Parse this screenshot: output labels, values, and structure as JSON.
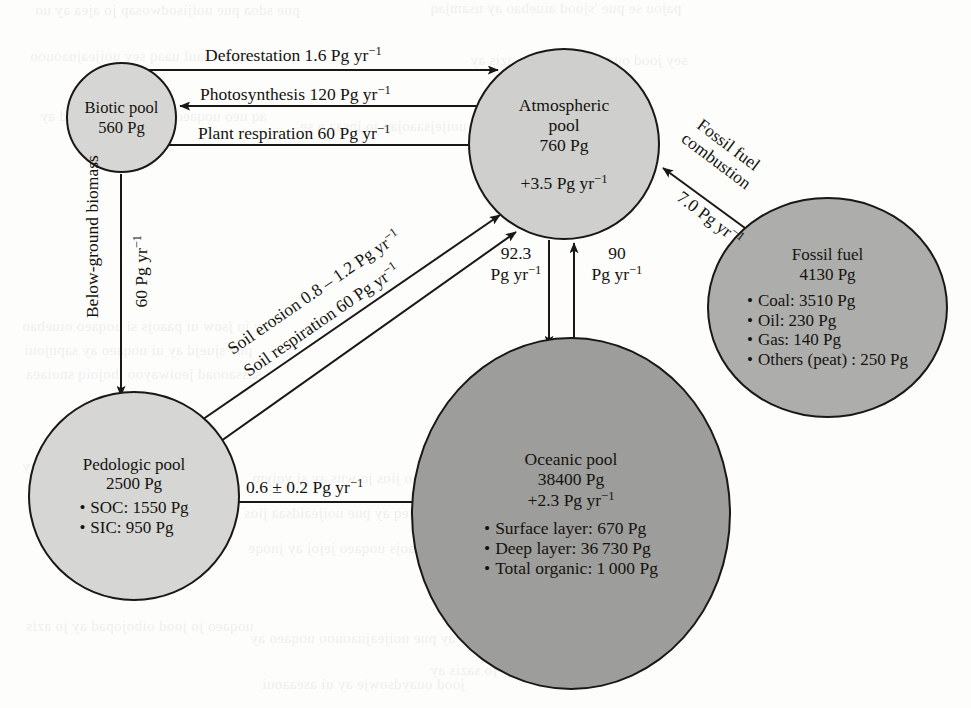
{
  "figure": {
    "type": "carbon-cycle-flow-diagram",
    "units": "Pg (petagrams C), fluxes in Pg yr^-1"
  },
  "pools": {
    "biotic": {
      "name": "Biotic pool",
      "stock": "560 Pg",
      "fill": "#d6d6d4"
    },
    "atmospheric": {
      "name": "Atmospheric\npool",
      "stock": "760 Pg",
      "delta": "+3.5 Pg yr",
      "delta_exp": "−1",
      "fill": "#cfcfcd"
    },
    "fossil": {
      "name": "Fossil fuel",
      "stock": "4130 Pg",
      "fill": "#adadab",
      "items": [
        "Coal: 3510 Pg",
        "Oil: 230 Pg",
        "Gas: 140 Pg",
        "Others (peat) : 250 Pg"
      ]
    },
    "pedologic": {
      "name": "Pedologic pool",
      "stock": "2500 Pg",
      "fill": "#d6d6d4",
      "items": [
        "SOC: 1550 Pg",
        "SIC: 950 Pg"
      ]
    },
    "oceanic": {
      "name": "Oceanic pool",
      "stock": "38400 Pg",
      "delta": "+2.3 Pg yr",
      "delta_exp": "−1",
      "fill": "#9d9d9b",
      "items": [
        "Surface layer: 670 Pg",
        "Deep layer: 36 730 Pg",
        "Total organic: 1 000 Pg"
      ]
    }
  },
  "flows": {
    "deforestation": {
      "text": "Deforestation 1.6 Pg yr",
      "exp": "−1"
    },
    "photosynthesis": {
      "text": "Photosynthesis 120 Pg yr",
      "exp": "−1"
    },
    "plant_respiration": {
      "text": "Plant respiration 60 Pg yr",
      "exp": "−1"
    },
    "below_ground_biomass": {
      "text": "Below-ground biomass"
    },
    "below_ground_rate": {
      "text": "60 Pg yr",
      "exp": "−1"
    },
    "soil_erosion": {
      "text": "Soil erosion 0.8 – 1.2 Pg yr",
      "exp": "−1"
    },
    "soil_respiration": {
      "text": "Soil respiration 60 Pg yr",
      "exp": "−1"
    },
    "atm_to_ocean": {
      "line1": "92.3",
      "line2": "Pg yr",
      "exp": "−1"
    },
    "ocean_to_atm": {
      "line1": "90",
      "line2": "Pg yr",
      "exp": "−1"
    },
    "ped_to_ocean": {
      "text": "0.6 ± 0.2 Pg yr",
      "exp": "−1"
    },
    "fossil_combustion": {
      "line1": "Fossil fuel",
      "line2": "combustion",
      "rate": "7.0 Pg yr",
      "exp": "−1"
    }
  },
  "style": {
    "stroke": "#1a1714",
    "page_bg": "#fdfdfc"
  },
  "bleed": [
    {
      "x": 35,
      "y": 2,
      "t": "pue sdoa pue uoijisodwosap jo ajea ay uo",
      "s": 15
    },
    {
      "x": 430,
      "y": 0,
      "t": "pajou se pue 'sjood aiuebao ay usamjaq",
      "s": 15
    },
    {
      "x": 30,
      "y": 48,
      "t": "ui paseaaul uaaq sey uoijeajuaouoo",
      "s": 15
    },
    {
      "x": 470,
      "y": 52,
      "t": "sey jood ouaydsowje ay jo azis ay",
      "s": 15
    },
    {
      "x": 40,
      "y": 108,
      "t": "aq ueo uoqaeo jo |ood oibojopad ay",
      "s": 15
    },
    {
      "x": 300,
      "y": 118,
      "t": "asn pue| pue uoijejsaaojap jo jnsaa e se",
      "s": 15
    },
    {
      "x": 22,
      "y": 318,
      "t": "ay jo jsow ui paaojs si uoqaeo oiuebao",
      "s": 15
    },
    {
      "x": 24,
      "y": 342,
      "t": "pue sjuejd ay ui uoqaeo ay sapnjoui",
      "s": 15
    },
    {
      "x": 26,
      "y": 366,
      "t": "sassaooad jeoiwayoo ibojoiq snoiaea",
      "s": 15
    },
    {
      "x": 22,
      "y": 458,
      "t": "si jood oibojopad ay jo azis ay",
      "s": 15
    },
    {
      "x": 252,
      "y": 470,
      "t": "uoqaeo oiuebao jios jo wns ay si yoiym",
      "s": 15
    },
    {
      "x": 244,
      "y": 505,
      "t": "jo aouejeq ay pue uoijeaidsaa jios",
      "s": 15
    },
    {
      "x": 248,
      "y": 540,
      "t": "ay ui paaojs uoqaeo jejoj ay jnoqe",
      "s": 15
    },
    {
      "x": 26,
      "y": 618,
      "t": "uoqaeo jo jood oibojopad ay jo azis",
      "s": 15
    },
    {
      "x": 250,
      "y": 630,
      "t": "ay pue uoijeajuaouoo uoqaeo ay",
      "s": 15
    },
    {
      "x": 430,
      "y": 662,
      "t": "smoy ay pue sjood ay jo sazis ay",
      "s": 15
    },
    {
      "x": 262,
      "y": 676,
      "t": "jood ouaydsowje ay ui aseaaoui",
      "s": 15
    }
  ]
}
